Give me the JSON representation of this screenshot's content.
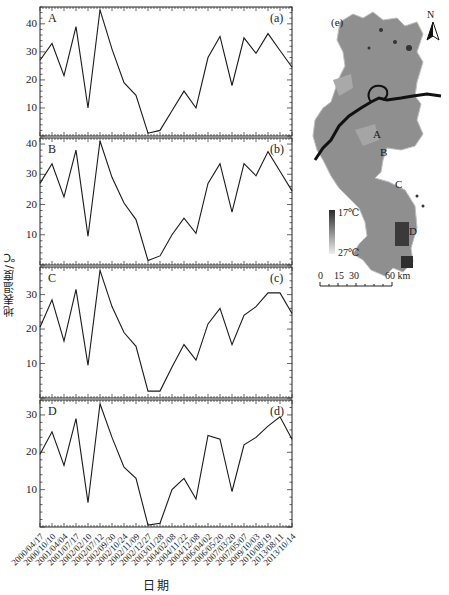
{
  "chart_data": [
    {
      "type": "line",
      "panel": "(a)",
      "site": "A",
      "ylim": [
        0,
        46
      ],
      "yticks": [
        10,
        20,
        30,
        40
      ],
      "values": [
        27,
        33,
        21.5,
        39,
        10,
        45,
        31,
        19,
        14.5,
        1,
        2,
        9,
        16,
        10,
        28,
        35.5,
        18,
        35,
        29.5,
        36.5,
        30.5,
        24.5
      ]
    },
    {
      "type": "line",
      "panel": "(b)",
      "site": "B",
      "ylim": [
        0,
        42
      ],
      "yticks": [
        10,
        20,
        30,
        40
      ],
      "values": [
        27,
        33.5,
        22.5,
        38,
        9.5,
        41,
        29,
        20.5,
        15,
        1.5,
        3,
        10,
        15.5,
        10.5,
        27,
        33.5,
        17.5,
        33.5,
        29.5,
        37.5,
        31,
        24.5
      ]
    },
    {
      "type": "line",
      "panel": "(c)",
      "site": "C",
      "ylim": [
        0,
        38
      ],
      "yticks": [
        10,
        20,
        30
      ],
      "values": [
        20.5,
        28.5,
        16.5,
        31.5,
        9.5,
        37,
        26.5,
        19,
        15,
        2,
        2,
        9,
        15.5,
        11,
        21.5,
        26,
        15.5,
        24,
        26.5,
        30.5,
        30.5,
        24.5
      ]
    },
    {
      "type": "line",
      "panel": "(d)",
      "site": "D",
      "ylim": [
        0,
        34
      ],
      "yticks": [
        10,
        20,
        30
      ],
      "values": [
        19.5,
        25.5,
        16.5,
        29,
        6.5,
        33,
        24,
        16,
        13,
        0.5,
        1,
        10,
        13,
        7.5,
        24.5,
        23.5,
        9.5,
        22,
        24,
        27,
        29.5,
        23.5
      ]
    }
  ],
  "x_dates": [
    "2000/04/17",
    "2000/10/10",
    "2001/04/04",
    "2001/07/17",
    "2002/02/10",
    "2002/07/12",
    "2002/09/30",
    "2002/10/24",
    "2002/11/09",
    "2002/12/27",
    "2003/01/28",
    "2004/02/08",
    "2004/11/22",
    "2004/12/08",
    "2006/04/02",
    "2006/05/20",
    "2007/03/20",
    "2007/05/07",
    "2009/10/03",
    "2010/08/19",
    "2013/08/11",
    "2013/10/14"
  ],
  "axes": {
    "xlabel": "日期",
    "ylabel": "地表温度/℃"
  },
  "map": {
    "panel": "(e)",
    "north": "N",
    "site_labels": [
      "A",
      "B",
      "C",
      "D"
    ],
    "legend_min": "17℃",
    "legend_max": "27℃",
    "scale_ticks": [
      "0",
      "15",
      "30",
      "60 km"
    ]
  },
  "colors": {
    "line": "#1a1a1a",
    "map_fill": "#8a8a8a",
    "river": "#111111"
  }
}
